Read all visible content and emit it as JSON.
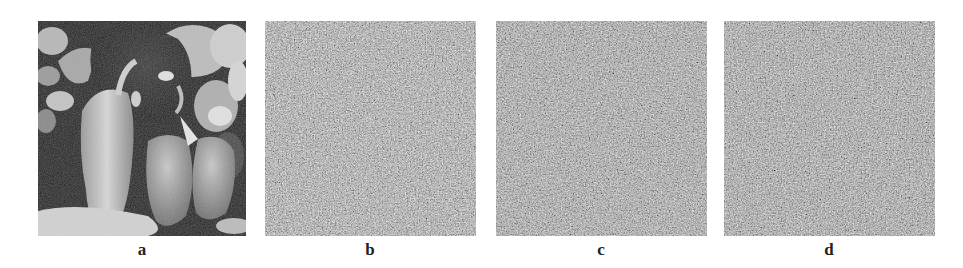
{
  "figure": {
    "panels": [
      {
        "id": "a",
        "label": "a",
        "kind": "peppers-grayscale-image",
        "x": 38,
        "width": 208
      },
      {
        "id": "b",
        "label": "b",
        "kind": "noise-encrypted-image",
        "x": 265,
        "width": 211
      },
      {
        "id": "c",
        "label": "c",
        "kind": "noise-encrypted-image",
        "x": 496,
        "width": 211
      },
      {
        "id": "d",
        "label": "d",
        "kind": "noise-encrypted-image",
        "x": 724,
        "width": 211
      }
    ],
    "colors": {
      "background": "#ffffff",
      "noise_mid": "#7a7a7a",
      "label": "#222222"
    }
  }
}
